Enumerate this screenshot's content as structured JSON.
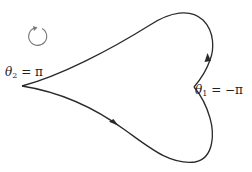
{
  "diagram": {
    "type": "closed contour with two cusps",
    "labels": {
      "left_cusp": {
        "symbol": "θ",
        "subscript": "2",
        "rest": " = π"
      },
      "right_cusp": {
        "symbol": "θ",
        "subscript": "1",
        "rest": " = −π"
      }
    },
    "orientation_icon": "counterclockwise-circular-arrow",
    "colors": {
      "curve": "#2a2a2a",
      "orientation_arrow": "#777777",
      "text": "#222222",
      "background": "#ffffff"
    }
  }
}
